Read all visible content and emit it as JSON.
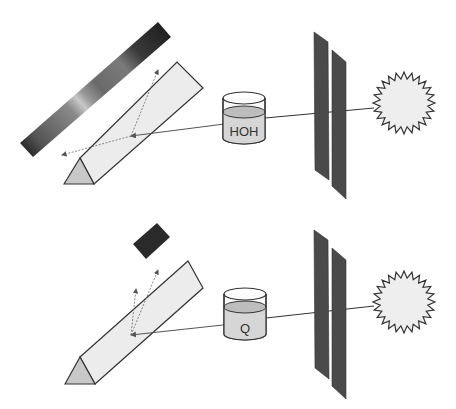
{
  "diagram": {
    "colors": {
      "background": "#ffffff",
      "outline": "#333333",
      "prism_fill": "#ececec",
      "prism_end_fill": "#c8c8c8",
      "slit_fill": "#4a4a4a",
      "liquid_fill": "#d6d6d6",
      "liquid_top": "#bdbdbd",
      "sun_fill": "#eeeeee",
      "ray": "#555555",
      "absorbed_block": "#2a2a2a"
    },
    "top_setup": {
      "sample_label": "HOH",
      "light_source": "sun-icon",
      "result": "continuous-spectrum-band"
    },
    "bottom_setup": {
      "sample_label": "Q",
      "light_source": "sun-icon",
      "result": "single-dark-band"
    }
  }
}
